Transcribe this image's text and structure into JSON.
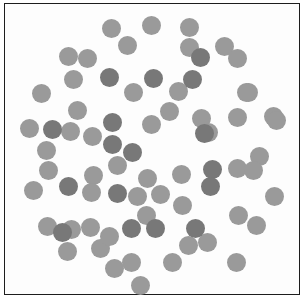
{
  "figure": {
    "type": "dot-cluster-plot",
    "width": 306,
    "height": 302,
    "background_color": "#ffffff",
    "panel_background_color": "#fdfdfd",
    "border_color": "#1d1d1d",
    "border_width_px": 1.4,
    "panel": {
      "x": 4,
      "y": 3,
      "width": 296,
      "height": 292
    },
    "axes_visible": false,
    "tick_labels_visible": false,
    "title": "",
    "legend_visible": false
  },
  "chart_data": {
    "type": "scatter",
    "title": "",
    "xlabel": "",
    "ylabel": "",
    "xlim": [
      4,
      300
    ],
    "ylim": [
      3,
      295
    ],
    "grid": false,
    "legend": null,
    "marker": "circle",
    "marker_diameter_px": 19,
    "colors": {
      "light_gray": "#9a9a9a",
      "dark_gray": "#787878"
    },
    "series": [
      {
        "name": "light_gray",
        "color": "#9a9a9a",
        "count": 57,
        "points": [
          [
            111,
            28
          ],
          [
            151,
            25
          ],
          [
            189,
            27
          ],
          [
            127,
            45
          ],
          [
            189,
            47
          ],
          [
            224,
            46
          ],
          [
            68,
            56
          ],
          [
            87,
            58
          ],
          [
            237,
            58
          ],
          [
            73,
            79
          ],
          [
            133,
            92
          ],
          [
            178,
            91
          ],
          [
            246,
            92
          ],
          [
            41,
            93
          ],
          [
            77,
            110
          ],
          [
            169,
            111
          ],
          [
            248,
            92
          ],
          [
            29,
            128
          ],
          [
            70,
            131
          ],
          [
            92,
            136
          ],
          [
            151,
            124
          ],
          [
            201,
            118
          ],
          [
            237,
            117
          ],
          [
            273,
            116
          ],
          [
            208,
            132
          ],
          [
            46,
            150
          ],
          [
            48,
            170
          ],
          [
            33,
            190
          ],
          [
            147,
            178
          ],
          [
            181,
            174
          ],
          [
            259,
            156
          ],
          [
            237,
            168
          ],
          [
            253,
            170
          ],
          [
            93,
            175
          ],
          [
            160,
            194
          ],
          [
            91,
            192
          ],
          [
            137,
            196
          ],
          [
            182,
            205
          ],
          [
            238,
            215
          ],
          [
            146,
            215
          ],
          [
            274,
            196
          ],
          [
            47,
            226
          ],
          [
            71,
            229
          ],
          [
            90,
            227
          ],
          [
            67,
            251
          ],
          [
            114,
            268
          ],
          [
            100,
            248
          ],
          [
            131,
            262
          ],
          [
            172,
            262
          ],
          [
            207,
            242
          ],
          [
            188,
            245
          ],
          [
            236,
            262
          ],
          [
            140,
            285
          ],
          [
            256,
            225
          ],
          [
            276,
            120
          ],
          [
            117,
            165
          ],
          [
            109,
            236
          ]
        ]
      },
      {
        "name": "dark_gray",
        "color": "#787878",
        "count": 17,
        "points": [
          [
            109,
            77
          ],
          [
            153,
            78
          ],
          [
            192,
            79
          ],
          [
            112,
            122
          ],
          [
            204,
            133
          ],
          [
            112,
            144
          ],
          [
            132,
            152
          ],
          [
            117,
            193
          ],
          [
            212,
            169
          ],
          [
            131,
            228
          ],
          [
            155,
            228
          ],
          [
            195,
            228
          ],
          [
            210,
            186
          ],
          [
            200,
            57
          ],
          [
            62,
            232
          ],
          [
            68,
            186
          ],
          [
            52,
            129
          ]
        ]
      }
    ],
    "total_points": 74,
    "distribution_shape": "circular cluster centered near (152,150)"
  }
}
